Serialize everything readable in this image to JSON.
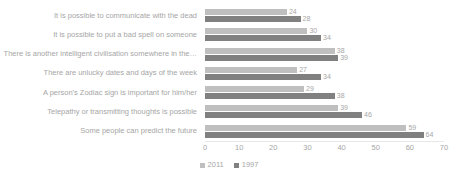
{
  "chart_data": {
    "type": "bar",
    "orientation": "horizontal",
    "title": "",
    "xlabel": "",
    "ylabel": "",
    "xlim": [
      0,
      70
    ],
    "xticks": [
      "0",
      "10",
      "20",
      "30",
      "40",
      "50",
      "60",
      "70"
    ],
    "grid": false,
    "legend_position": "bottom",
    "categories": [
      "It is possible to communicate with the dead",
      "It is possible to put a bad spell on someone",
      "There is another intelligent civilisation somewhere in the…",
      "There are unlucky dates and days of the week",
      "A person's Zodiac sign is important for him/her",
      "Telepathy or transmitting thoughts is possible",
      "Some people can predict the future"
    ],
    "series": [
      {
        "name": "2011",
        "color": "#bfbfbf",
        "values": [
          24,
          30,
          38,
          27,
          29,
          39,
          59
        ]
      },
      {
        "name": "1997",
        "color": "#808080",
        "values": [
          28,
          34,
          39,
          34,
          38,
          46,
          64
        ]
      }
    ]
  },
  "legend": {
    "items": [
      {
        "label": "2011",
        "color": "#bfbfbf"
      },
      {
        "label": "1997",
        "color": "#808080"
      }
    ]
  }
}
